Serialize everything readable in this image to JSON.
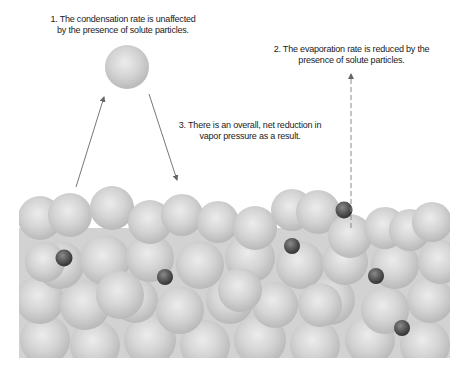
{
  "diagram": {
    "labels": [
      {
        "id": "condensation",
        "number": "1.",
        "lines": [
          "1. The condensation rate is unaffected",
          "by the presence of solute particles."
        ]
      },
      {
        "id": "evaporation",
        "number": "2.",
        "lines": [
          "2. The evaporation rate is reduced by the",
          "presence of solute particles."
        ]
      },
      {
        "id": "net",
        "number": "3.",
        "lines": [
          "3. There is an overall, net reduction in",
          "vapor pressure as a result."
        ]
      }
    ],
    "arrows": [
      {
        "name": "evaporation-arrow",
        "style": "solid",
        "from": [
          76,
          187
        ],
        "to": [
          104,
          97
        ]
      },
      {
        "name": "condensation-arrow",
        "style": "solid",
        "from": [
          149,
          94
        ],
        "to": [
          177,
          180
        ]
      },
      {
        "name": "blocked-evaporation-arrow",
        "style": "dashed",
        "from": [
          351,
          228
        ],
        "to": [
          351,
          73
        ]
      }
    ],
    "colors": {
      "solvent_particle": "#c8c8c8",
      "solute_particle": "#555555",
      "arrow": "#777777",
      "text": "#1a1a1a",
      "liquid_bg": "#d0d0d0"
    }
  }
}
